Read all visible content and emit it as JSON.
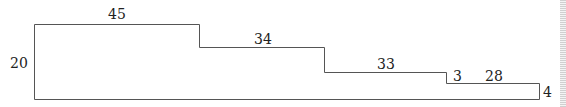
{
  "diagram": {
    "type": "stepped-outline",
    "stroke_color": "#555555",
    "labels": {
      "top_width": "45",
      "left_height": "20",
      "step2_width": "34",
      "step3_width": "33",
      "step4_rise": "3",
      "step4_width": "28",
      "right_height": "4"
    }
  }
}
